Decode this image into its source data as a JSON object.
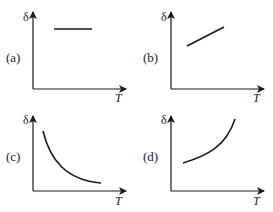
{
  "figure": {
    "y_axis_label": "δ",
    "x_axis_label": "T",
    "colors": {
      "ink": "#1a1a1a",
      "background": "#ffffff"
    },
    "panels": [
      {
        "id": "a",
        "label": "(a)",
        "trend": "constant"
      },
      {
        "id": "b",
        "label": "(b)",
        "trend": "linear increasing"
      },
      {
        "id": "c",
        "label": "(c)",
        "trend": "decreasing, decaying curve"
      },
      {
        "id": "d",
        "label": "(d)",
        "trend": "increasing, growing curve"
      }
    ]
  }
}
